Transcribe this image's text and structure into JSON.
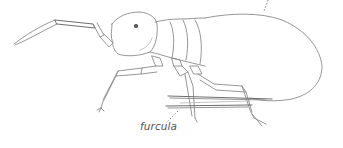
{
  "figure": {
    "labels": [
      {
        "id": "furcula",
        "text": "furcula"
      }
    ],
    "colors": {
      "ink": "#8a8a8a",
      "label": "#555555",
      "background": "#ffffff"
    }
  }
}
